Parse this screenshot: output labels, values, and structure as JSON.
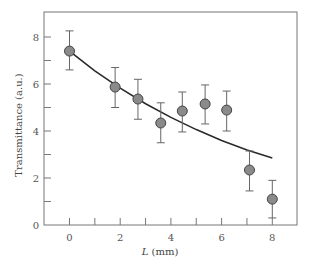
{
  "chart_data": {
    "type": "scatter",
    "title": "",
    "xlabel": "L (mm)",
    "xlabel_var": "L",
    "xlabel_unit": " (mm)",
    "ylabel": "Transmittance (a.u.)",
    "xlim": [
      -0.9,
      9.0
    ],
    "ylim": [
      0,
      8.55
    ],
    "x_ticks_major": [
      0,
      2,
      4,
      6,
      8
    ],
    "x_ticks_minor": [
      1,
      3,
      5,
      7
    ],
    "y_ticks_major": [
      0,
      2,
      4,
      6,
      8
    ],
    "y_ticks_minor": [
      1,
      3,
      5,
      7
    ],
    "grid": false,
    "legend": null,
    "series": [
      {
        "name": "Measured",
        "kind": "points-with-error-bars",
        "marker_color": "#8a8a8a",
        "x": [
          0.0,
          1.8,
          2.7,
          3.6,
          4.45,
          5.35,
          6.2,
          7.1,
          8.0
        ],
        "y": [
          7.4,
          5.87,
          5.36,
          4.34,
          4.85,
          5.15,
          4.89,
          2.34,
          1.1
        ],
        "y_upper": [
          8.26,
          6.7,
          6.2,
          5.2,
          5.66,
          5.96,
          5.7,
          3.15,
          1.9
        ],
        "y_lower": [
          6.6,
          5.0,
          4.5,
          3.5,
          3.96,
          4.3,
          4.0,
          1.45,
          0.3
        ]
      },
      {
        "name": "Fit",
        "kind": "line",
        "line_color": "#2a2a2a",
        "x": [
          0,
          1,
          2,
          3,
          4,
          5,
          6,
          7,
          8
        ],
        "y": [
          7.4,
          6.56,
          5.82,
          5.16,
          4.58,
          4.06,
          3.6,
          3.19,
          2.85
        ]
      }
    ]
  }
}
